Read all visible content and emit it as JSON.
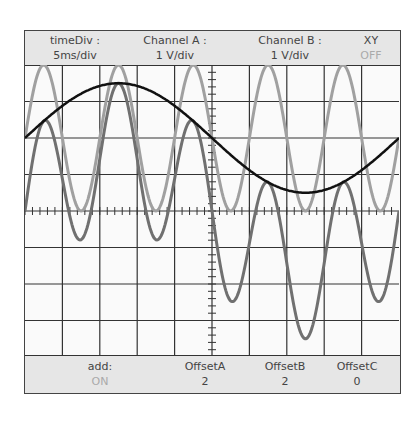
{
  "header": {
    "timeDiv": {
      "label": "timeDiv :",
      "value": "5ms/div"
    },
    "channelA": {
      "label": "Channel A :",
      "value": "1 V/div"
    },
    "channelB": {
      "label": "Channel B :",
      "value": "1 V/div"
    },
    "xy": {
      "label": "XY",
      "value": "OFF"
    }
  },
  "footer": {
    "add": {
      "label": "add:",
      "value": "ON"
    },
    "offsetA": {
      "label": "OffsetA",
      "value": "2"
    },
    "offsetB": {
      "label": "OffsetB",
      "value": "2"
    },
    "offsetC": {
      "label": "OffsetC",
      "value": "0"
    }
  },
  "screen": {
    "divisions_x": 10,
    "divisions_y": 8,
    "colors": {
      "grid": "#333333",
      "channelA": "#a0a0a0",
      "channelB": "#111111",
      "sum": "#707070"
    },
    "traces": {
      "channelA": {
        "amplitude_div": 2.0,
        "period_div": 2.0,
        "phase_div": 0.5,
        "offset_div": 2
      },
      "channelB": {
        "amplitude_div": 1.5,
        "period_div": 10.0,
        "phase_div": 0.0,
        "offset_div": 2
      },
      "sum": {
        "offset_div": 0
      }
    }
  }
}
